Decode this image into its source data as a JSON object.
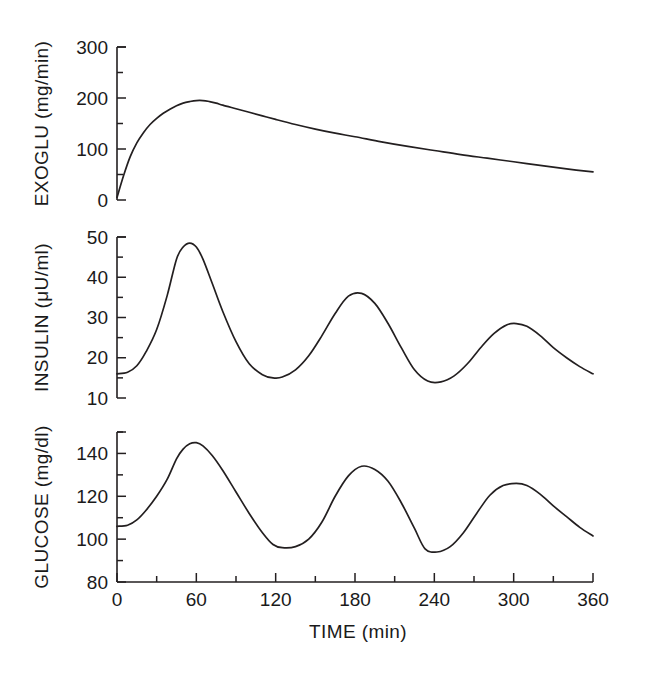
{
  "figure": {
    "background_color": "#ffffff",
    "line_color": "#231f20",
    "xlabel": "TIME (min)",
    "x_ticks_major": [
      0,
      60,
      120,
      180,
      240,
      300,
      360
    ],
    "x_ticks_minor": [
      30,
      90,
      150,
      210,
      270,
      330
    ]
  },
  "chart_data": [
    {
      "type": "line",
      "title": "",
      "panel": "top",
      "ylabel": "EXOGLU  (mg/min)",
      "ylabel_quantity": "EXOGLU",
      "ylabel_units": "mg/min",
      "xlabel": "TIME (min)",
      "xlim": [
        0,
        360
      ],
      "ylim": [
        0,
        300
      ],
      "y_ticks_major": [
        0,
        100,
        200,
        300
      ],
      "y_ticks_minor": [
        50,
        150,
        250
      ],
      "x_ticks_major": [
        0,
        60,
        120,
        180,
        240,
        300,
        360
      ],
      "grid": false,
      "legend": "none",
      "series": [
        {
          "name": "EXOGLU",
          "x": [
            0,
            5,
            10,
            15,
            20,
            25,
            30,
            35,
            40,
            45,
            50,
            55,
            60,
            65,
            70,
            75,
            80,
            90,
            100,
            110,
            120,
            135,
            150,
            165,
            180,
            200,
            220,
            240,
            260,
            280,
            300,
            320,
            340,
            360
          ],
          "y": [
            5,
            48,
            85,
            112,
            132,
            148,
            160,
            170,
            178,
            185,
            190,
            193,
            195,
            195,
            193,
            190,
            186,
            179,
            172,
            165,
            158,
            148,
            139,
            131,
            124,
            114,
            105,
            97,
            89,
            82,
            75,
            68,
            61,
            55
          ]
        }
      ]
    },
    {
      "type": "line",
      "title": "",
      "panel": "middle",
      "ylabel": "INSULIN  (μU/ml)",
      "ylabel_quantity": "INSULIN",
      "ylabel_units": "μU/ml",
      "xlabel": "TIME (min)",
      "xlim": [
        0,
        360
      ],
      "ylim": [
        10,
        50
      ],
      "y_ticks_major": [
        10,
        20,
        30,
        40,
        50
      ],
      "y_ticks_minor": [
        15,
        25,
        35,
        45
      ],
      "x_ticks_major": [
        0,
        60,
        120,
        180,
        240,
        300,
        360
      ],
      "grid": false,
      "legend": "none",
      "series": [
        {
          "name": "INSULIN",
          "x": [
            0,
            8,
            15,
            22,
            30,
            38,
            45,
            50,
            55,
            60,
            65,
            72,
            80,
            90,
            100,
            110,
            118,
            125,
            135,
            145,
            155,
            165,
            175,
            185,
            195,
            205,
            215,
            225,
            235,
            245,
            255,
            265,
            275,
            285,
            295,
            302,
            310,
            320,
            330,
            340,
            350,
            360
          ],
          "y": [
            16.0,
            16.4,
            18.0,
            21.5,
            27.0,
            35.5,
            44.5,
            47.5,
            48.5,
            47.5,
            44.5,
            38.5,
            31.5,
            24.0,
            18.5,
            15.8,
            15.0,
            15.2,
            17.0,
            20.5,
            25.5,
            31.0,
            35.3,
            36.0,
            33.5,
            28.5,
            22.5,
            17.0,
            14.2,
            14.0,
            15.5,
            18.5,
            22.5,
            26.0,
            28.2,
            28.5,
            27.8,
            25.5,
            22.5,
            20.0,
            17.8,
            16.0
          ]
        }
      ]
    },
    {
      "type": "line",
      "title": "",
      "panel": "bottom",
      "ylabel": "GLUCOSE  (mg/dl)",
      "ylabel_quantity": "GLUCOSE",
      "ylabel_units": "mg/dl",
      "xlabel": "TIME (min)",
      "xlim": [
        0,
        360
      ],
      "ylim": [
        80,
        150
      ],
      "y_ticks_major": [
        80,
        100,
        120,
        140
      ],
      "y_ticks_minor": [
        90,
        110,
        130,
        150
      ],
      "x_ticks_major": [
        0,
        60,
        120,
        180,
        240,
        300,
        360
      ],
      "grid": false,
      "legend": "none",
      "series": [
        {
          "name": "GLUCOSE",
          "x": [
            0,
            8,
            15,
            22,
            30,
            38,
            45,
            50,
            55,
            60,
            65,
            72,
            80,
            90,
            100,
            110,
            118,
            125,
            135,
            145,
            155,
            165,
            175,
            185,
            195,
            205,
            215,
            225,
            233,
            242,
            252,
            262,
            272,
            282,
            292,
            302,
            310,
            320,
            330,
            340,
            350,
            360
          ],
          "y": [
            106.0,
            106.5,
            109.0,
            113.5,
            120.0,
            128.0,
            137.5,
            142.0,
            144.5,
            145.0,
            143.5,
            139.0,
            132.0,
            122.0,
            112.0,
            103.0,
            97.5,
            96.0,
            96.5,
            100.0,
            108.0,
            120.0,
            129.5,
            134.0,
            132.5,
            127.0,
            117.0,
            105.0,
            95.5,
            94.0,
            96.5,
            103.0,
            112.0,
            120.5,
            125.0,
            126.0,
            125.0,
            121.0,
            115.5,
            110.5,
            105.5,
            101.5
          ]
        }
      ]
    }
  ]
}
